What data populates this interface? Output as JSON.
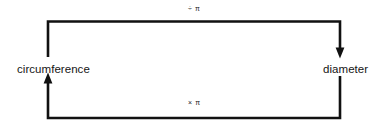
{
  "diagram": {
    "type": "cycle",
    "background_color": "#ffffff",
    "stroke_color": "#111111",
    "nodes": [
      {
        "id": "circumference",
        "label": "circumference"
      },
      {
        "id": "diameter",
        "label": "diameter"
      }
    ],
    "edges": [
      {
        "id": "top-edge",
        "from": "circumference",
        "to": "diameter",
        "label": "÷ π",
        "operation_icon": "divide-icon",
        "direction": "down-arrow-at-diameter"
      },
      {
        "id": "bottom-edge",
        "from": "diameter",
        "to": "circumference",
        "label": "× π",
        "operation_icon": "multiply-icon",
        "direction": "up-arrow-at-circumference"
      }
    ]
  }
}
